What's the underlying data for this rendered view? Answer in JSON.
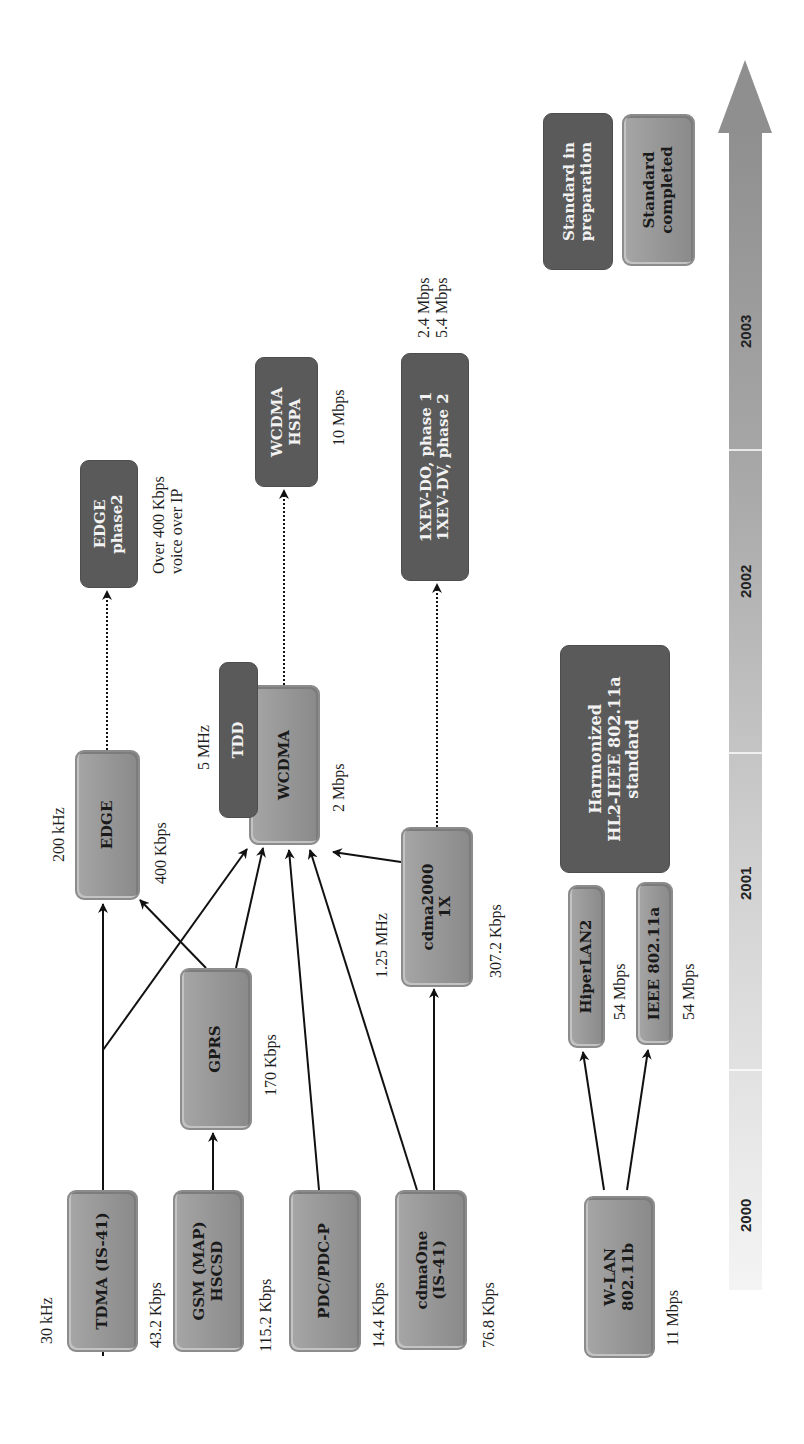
{
  "timeline": {
    "years": [
      "2000",
      "2001",
      "2002",
      "2003"
    ]
  },
  "legend": {
    "preparation": "Standard in\npreparation",
    "completed": "Standard\ncompleted"
  },
  "nodes": {
    "tdma": {
      "label": "TDMA (IS-41)",
      "top_note": "30 kHz",
      "bottom_note": "43.2 Kbps",
      "status": "completed"
    },
    "gsm": {
      "label": "GSM (MAP)\nHSCSD",
      "bottom_note": "115.2 Kbps",
      "status": "completed"
    },
    "pdc": {
      "label": "PDC/PDC-P",
      "bottom_note": "14.4 Kbps",
      "status": "completed"
    },
    "cdmaone": {
      "label": "cdmaOne\n(IS-41)",
      "bottom_note": "76.8 Kbps",
      "status": "completed"
    },
    "wlan": {
      "label": "W-LAN\n802.11b",
      "bottom_note": "11 Mbps",
      "status": "completed"
    },
    "gprs": {
      "label": "GPRS",
      "bottom_note": "170 Kbps",
      "status": "completed"
    },
    "edge": {
      "label": "EDGE",
      "top_note": "200 kHz",
      "bottom_note": "400 Kbps",
      "status": "completed"
    },
    "wcdma": {
      "label": "WCDMA",
      "bottom_note": "2 Mbps",
      "status": "completed"
    },
    "tdd": {
      "label": "TDD",
      "top_note": "5 MHz",
      "status": "preparation"
    },
    "cdma2000": {
      "label": "cdma2000\n1X",
      "top_note": "1.25 MHz",
      "bottom_note": "307.2 Kbps",
      "status": "completed"
    },
    "hiperlan2": {
      "label": "HiperLAN2",
      "bottom_note": "54 Mbps",
      "status": "completed"
    },
    "ieee80211a": {
      "label": "IEEE 802.11a",
      "bottom_note": "54 Mbps",
      "status": "completed"
    },
    "harmonized": {
      "label": "Harmonized\nHL2-IEEE 802.11a\nstandard",
      "status": "preparation"
    },
    "edge_phase2": {
      "label": "EDGE\nphase2",
      "bottom_note": "Over 400 Kbps\nvoice over IP",
      "status": "preparation"
    },
    "wcdma_hspa": {
      "label": "WCDMA\nHSPA",
      "bottom_note": "10 Mbps",
      "status": "preparation"
    },
    "xev": {
      "label": "1XEV-DO, phase 1\n1XEV-DV, phase 2",
      "bottom_note": "2.4 Mbps\n5.4 Mbps",
      "status": "preparation"
    }
  },
  "edges": [
    {
      "from": "tdma",
      "to": "edge",
      "style": "solid"
    },
    {
      "from": "tdma",
      "to": "wcdma",
      "style": "solid"
    },
    {
      "from": "gsm",
      "to": "gprs",
      "style": "solid"
    },
    {
      "from": "gprs",
      "to": "edge",
      "style": "solid"
    },
    {
      "from": "gprs",
      "to": "wcdma",
      "style": "solid"
    },
    {
      "from": "pdc",
      "to": "wcdma",
      "style": "solid"
    },
    {
      "from": "cdmaone",
      "to": "wcdma",
      "style": "solid"
    },
    {
      "from": "cdmaone",
      "to": "cdma2000",
      "style": "solid"
    },
    {
      "from": "cdma2000",
      "to": "wcdma",
      "style": "solid"
    },
    {
      "from": "wlan",
      "to": "hiperlan2",
      "style": "solid"
    },
    {
      "from": "wlan",
      "to": "ieee80211a",
      "style": "solid"
    },
    {
      "from": "edge",
      "to": "edge_phase2",
      "style": "dotted"
    },
    {
      "from": "wcdma",
      "to": "wcdma_hspa",
      "style": "dotted"
    },
    {
      "from": "cdma2000",
      "to": "xev",
      "style": "dotted"
    }
  ]
}
